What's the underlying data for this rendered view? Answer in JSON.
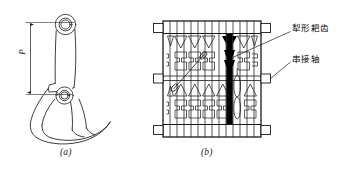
{
  "figure": {
    "title_present": false,
    "background_color": "#ffffff",
    "line_color": "#1a1a1a",
    "fill_highlight_color": "#000000",
    "panels": [
      {
        "id": "a",
        "caption": "(a)",
        "description": "side-profile of plow-shaped rake tooth",
        "dimension_label": "P"
      },
      {
        "id": "b",
        "caption": "(b)",
        "description": "front view of rake tooth assembly on series shaft"
      }
    ]
  },
  "annotations": [
    {
      "key": "teeth",
      "text": "犁形耙齿",
      "points_to": "highlighted-tooth"
    },
    {
      "key": "shaft",
      "text": "串接轴",
      "points_to": "right-middle-tab"
    }
  ],
  "captions": {
    "panel_a": "(a)",
    "panel_b": "(b)"
  },
  "dimension": {
    "letter": "P"
  },
  "assembly": {
    "tooth_count": 14,
    "highlighted_tooth_index": 8,
    "left_tabs": 3,
    "right_tabs": 3
  }
}
